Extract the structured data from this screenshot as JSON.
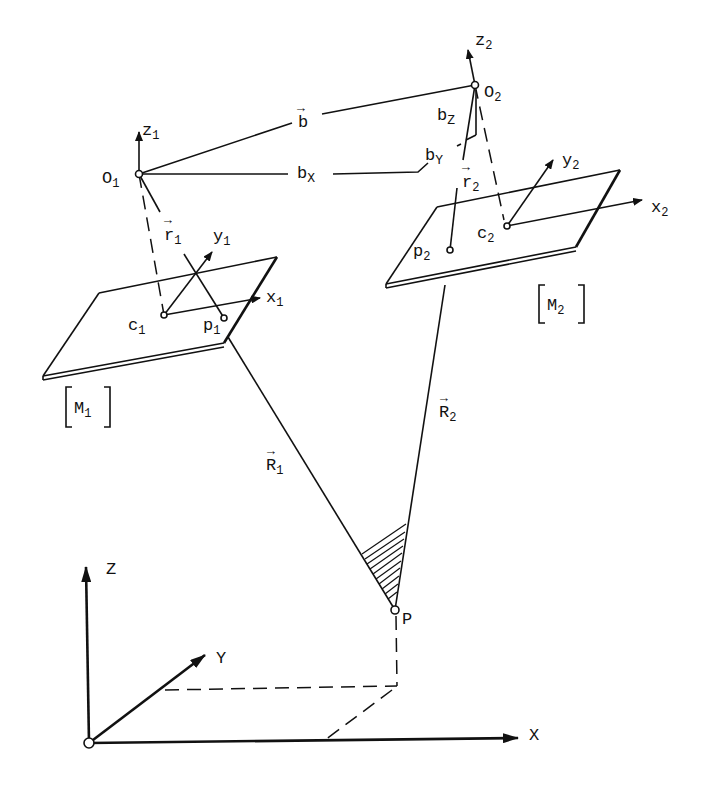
{
  "diagram": {
    "type": "stereo photogrammetry geometry",
    "background": "#ffffff",
    "ink": "#111111",
    "labels": {
      "z1": "z",
      "z1_sub": "1",
      "O1": "O",
      "O1_sub": "1",
      "r1": "r",
      "r1_sub": "1",
      "r1_arrow": "→",
      "y1": "y",
      "y1_sub": "1",
      "x1": "x",
      "x1_sub": "1",
      "c1": "c",
      "c1_sub": "1",
      "p1": "p",
      "p1_sub": "1",
      "M1": "M",
      "M1_sub": "1",
      "b": "b",
      "b_arrow": "→",
      "bX": "b",
      "bX_sub": "X",
      "bY": "b",
      "bY_sub": "Y",
      "bZ": "b",
      "bZ_sub": "Z",
      "z2": "z",
      "z2_sub": "2",
      "O2": "O",
      "O2_sub": "2",
      "r2": "r",
      "r2_sub": "2",
      "r2_arrow": "→",
      "y2": "y",
      "y2_sub": "2",
      "x2": "x",
      "x2_sub": "2",
      "c2": "c",
      "c2_sub": "2",
      "p2": "p",
      "p2_sub": "2",
      "M2": "M",
      "M2_sub": "2",
      "R1": "R",
      "R1_sub": "1",
      "R1_arrow": "→",
      "R2": "R",
      "R2_sub": "2",
      "R2_arrow": "→",
      "P": "P",
      "X": "X",
      "Y": "Y",
      "Z": "Z"
    },
    "points": {
      "O1": [
        139,
        174
      ],
      "O2": [
        475,
        85
      ],
      "c1": [
        164,
        315
      ],
      "p1": [
        224,
        318
      ],
      "c2": [
        507,
        226
      ],
      "p2": [
        450,
        250
      ],
      "P": [
        395,
        610
      ],
      "world_origin": [
        89,
        743
      ]
    },
    "image_planes": [
      {
        "name": "M1",
        "corners": [
          [
            99,
            293
          ],
          [
            277,
            257
          ],
          [
            224,
            343
          ],
          [
            43,
            376
          ]
        ]
      },
      {
        "name": "M2",
        "corners": [
          [
            437,
            207
          ],
          [
            620,
            170
          ],
          [
            576,
            247
          ],
          [
            386,
            284
          ]
        ]
      }
    ]
  }
}
